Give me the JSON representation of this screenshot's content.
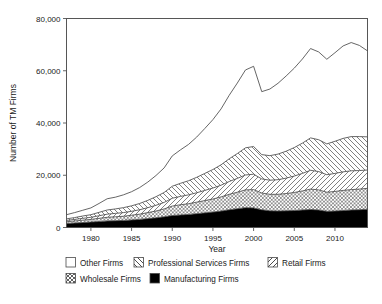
{
  "chart_data": {
    "type": "area",
    "stacked": true,
    "title": "",
    "xlabel": "Year",
    "ylabel": "Number of TM Firms",
    "xlim": [
      1977,
      2014
    ],
    "ylim": [
      0,
      80000
    ],
    "xticks": [
      1980,
      1985,
      1990,
      1995,
      2000,
      2005,
      2010
    ],
    "xtick_labels": [
      "1980",
      "1985",
      "1990",
      "1995",
      "2000",
      "2005",
      "2010"
    ],
    "yticks": [
      0,
      20000,
      40000,
      60000,
      80000
    ],
    "ytick_labels": [
      "0",
      "20,000",
      "40,000",
      "60,000",
      "80,000"
    ],
    "grid": false,
    "legend_position": "below",
    "x": [
      1977,
      1978,
      1979,
      1980,
      1981,
      1982,
      1983,
      1984,
      1985,
      1986,
      1987,
      1988,
      1989,
      1990,
      1991,
      1992,
      1993,
      1994,
      1995,
      1996,
      1997,
      1998,
      1999,
      2000,
      2001,
      2002,
      2003,
      2004,
      2005,
      2006,
      2007,
      2008,
      2009,
      2010,
      2011,
      2012,
      2013,
      2014
    ],
    "series": [
      {
        "name": "Manufacturing Firms",
        "pattern": "solid-black",
        "values": [
          1500,
          1700,
          1900,
          2100,
          2300,
          2500,
          2600,
          2700,
          2900,
          3100,
          3400,
          3700,
          4100,
          4600,
          4800,
          5000,
          5300,
          5600,
          5900,
          6300,
          6800,
          7200,
          7600,
          7500,
          6800,
          6400,
          6300,
          6400,
          6500,
          6700,
          6900,
          6700,
          6200,
          6300,
          6500,
          6700,
          6800,
          7000
        ]
      },
      {
        "name": "Wholesale Firms",
        "pattern": "crosshatch-x",
        "values": [
          700,
          800,
          900,
          1000,
          1200,
          1400,
          1500,
          1600,
          1800,
          2000,
          2300,
          2600,
          3000,
          3600,
          3900,
          4100,
          4400,
          4700,
          5000,
          5400,
          5900,
          6300,
          6800,
          7000,
          6400,
          6300,
          6400,
          6600,
          6900,
          7300,
          7800,
          7700,
          7300,
          7500,
          7700,
          7800,
          7900,
          8000
        ]
      },
      {
        "name": "Retail Firms",
        "pattern": "diagonal-forward",
        "values": [
          500,
          600,
          700,
          800,
          1000,
          1200,
          1300,
          1400,
          1500,
          1700,
          1900,
          2200,
          2500,
          3000,
          3200,
          3400,
          3600,
          3900,
          4200,
          4500,
          4900,
          5300,
          5700,
          5900,
          5400,
          5400,
          5600,
          5900,
          6300,
          6700,
          7200,
          7000,
          6700,
          6900,
          7100,
          7200,
          7100,
          7000
        ]
      },
      {
        "name": "Professional Services Firms",
        "pattern": "diagonal-back",
        "values": [
          600,
          700,
          900,
          1000,
          1300,
          1600,
          1700,
          1900,
          2100,
          2400,
          2800,
          3300,
          3800,
          4600,
          5000,
          5400,
          5900,
          6500,
          7100,
          7800,
          8700,
          9500,
          10400,
          10600,
          9300,
          9400,
          9800,
          10300,
          10900,
          11600,
          12400,
          12200,
          11800,
          12300,
          12800,
          13100,
          13000,
          12700
        ]
      },
      {
        "name": "Other Firms",
        "pattern": "white-empty",
        "values": [
          1600,
          1900,
          2200,
          2600,
          3400,
          4300,
          4500,
          4900,
          5400,
          6100,
          7000,
          8100,
          9400,
          11600,
          12800,
          13900,
          15400,
          17200,
          19100,
          21400,
          24300,
          27000,
          29800,
          30700,
          24100,
          25500,
          27100,
          28800,
          30400,
          32200,
          34200,
          33600,
          32400,
          33900,
          35400,
          36000,
          34900,
          32900
        ]
      }
    ],
    "totals": [
      4900,
      5700,
      6600,
      7500,
      9200,
      11000,
      11600,
      12500,
      13700,
      15300,
      17400,
      19900,
      22800,
      27400,
      29700,
      31800,
      34600,
      37900,
      41300,
      45400,
      50600,
      55300,
      60300,
      61700,
      51900,
      53000,
      55200,
      58000,
      61000,
      64500,
      68500,
      67200,
      64400,
      66900,
      69500,
      70800,
      69700,
      67600
    ]
  },
  "legend": {
    "items": [
      {
        "label": "Other Firms",
        "pattern": "white-empty"
      },
      {
        "label": "Professional Services Firms",
        "pattern": "diagonal-back"
      },
      {
        "label": "Retail Firms",
        "pattern": "diagonal-forward"
      },
      {
        "label": "Wholesale Firms",
        "pattern": "crosshatch-x"
      },
      {
        "label": "Manufacturing Firms",
        "pattern": "solid-black"
      }
    ]
  },
  "colors": {
    "line": "#4a4a4a",
    "frame": "#555555",
    "text": "#1a1a1a",
    "fill_black": "#000000",
    "fill_white": "#ffffff",
    "background": "#ffffff"
  }
}
